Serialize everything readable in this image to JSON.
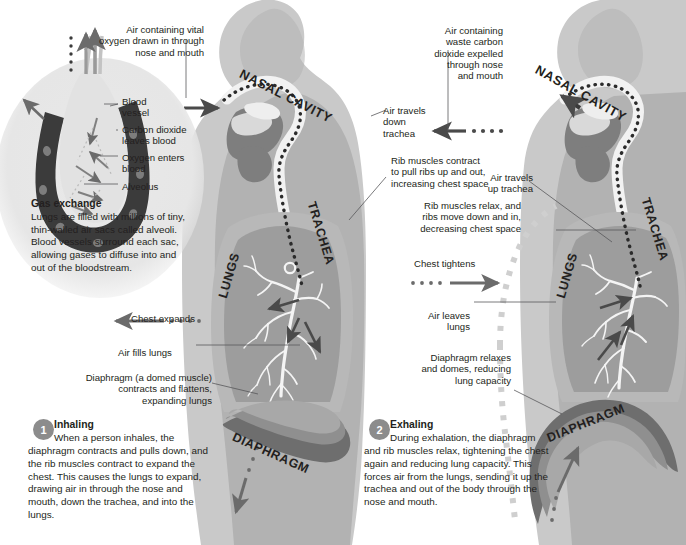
{
  "palette": {
    "ink": "#231f20",
    "body_outer": "#c9c9c9",
    "body_inner": "#b2b2b2",
    "lung_outer": "#b8b8b8",
    "lung_inner": "#9d9d9d",
    "airway_white": "#f2f2f2",
    "mouth_dark": "#7e7e7e",
    "diaphragm_dark": "#6e6e6e",
    "diaphragm_mid": "#8f8f8f",
    "arrow_gray": "#6b6b6b",
    "arrow_dark": "#4a4a4a",
    "inset_bg": "#e6e6e6",
    "alveolus_dark": "#3b3b3b",
    "numcircle": "#8c8c8c",
    "leader_line": "#58585a"
  },
  "inset": {
    "heading": "Gas exchange",
    "body": "Lungs are filled with millions of tiny, thin-walled air sacs called alveoli. Blood vessels surround each sac, allowing gases to diffuse into and out of the bloodstream.",
    "labels": [
      {
        "id": "blood-vessel",
        "text": "Blood\nvessel"
      },
      {
        "id": "carbon-dioxide",
        "text": "Carbon dioxide\nleaves blood"
      },
      {
        "id": "oxygen-enters",
        "text": "Oxygen enters\nblood"
      },
      {
        "id": "alveolus",
        "text": "Alveolus"
      }
    ]
  },
  "left_figure": {
    "caption_top": "Air containing vital\noxygen drawn in through\nnose and mouth",
    "anatomy": {
      "nasal_cavity": "NASAL CAVITY",
      "trachea": "TRACHEA",
      "lungs": "LUNGS",
      "diaphragm": "DIAPHRAGM"
    },
    "annotations": [
      {
        "id": "chest-expands",
        "text": "Chest expands"
      },
      {
        "id": "air-fills-lungs",
        "text": "Air fills lungs"
      },
      {
        "id": "diaphragm-note",
        "text": "Diaphragm (a domed muscle)\ncontracts and flattens,\nexpanding lungs"
      }
    ],
    "step": {
      "number": "1",
      "heading": "Inhaling",
      "body": "When a person inhales, the diaphragm contracts and pulls down, and the rib muscles contract to expand the chest. This causes the lungs to expand, drawing air in through the nose and mouth, down the trachea, and into the lungs."
    }
  },
  "right_figure": {
    "caption_top": "Air containing\nwaste carbon\ndioxide expelled\nthrough nose\nand mouth",
    "anatomy": {
      "nasal_cavity": "NASAL CAVITY",
      "trachea": "TRACHEA",
      "lungs": "LUNGS",
      "diaphragm": "DIAPHRAGM"
    },
    "annotations": [
      {
        "id": "air-travels-down-trachea",
        "text": "Air travels\ndown\ntrachea"
      },
      {
        "id": "rib-muscles-contract",
        "text": "Rib muscles contract\nto pull ribs up and out,\nincreasing chest space"
      },
      {
        "id": "air-travels-up-trachea",
        "text": "Air travels\nup trachea"
      },
      {
        "id": "rib-muscles-relax",
        "text": "Rib muscles relax, and\nribs move down and in,\ndecreasing chest space"
      },
      {
        "id": "chest-tightens",
        "text": "Chest tightens"
      },
      {
        "id": "air-leaves-lungs",
        "text": "Air leaves\nlungs"
      },
      {
        "id": "diaphragm-relaxes",
        "text": "Diaphragm relaxes\nand domes, reducing\nlung capacity"
      }
    ],
    "step": {
      "number": "2",
      "heading": "Exhaling",
      "body": "During exhalation, the diaphragm and rib muscles relax, tightening the chest again and reducing lung capacity. This forces air from the lungs, sending it up the trachea and out of the body through the nose and mouth."
    }
  }
}
